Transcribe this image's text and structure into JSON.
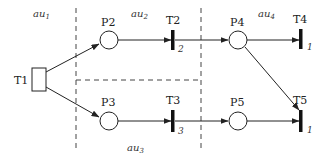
{
  "diagram": {
    "type": "petri-net",
    "zones": [
      {
        "id": "au1",
        "base": "au",
        "sub": "1"
      },
      {
        "id": "au2",
        "base": "au",
        "sub": "2"
      },
      {
        "id": "au3",
        "base": "au",
        "sub": "3"
      },
      {
        "id": "au4",
        "base": "au",
        "sub": "4"
      }
    ],
    "places": [
      {
        "id": "P2",
        "label": "P2"
      },
      {
        "id": "P3",
        "label": "P3"
      },
      {
        "id": "P4",
        "label": "P4"
      },
      {
        "id": "P5",
        "label": "P5"
      }
    ],
    "transitions": [
      {
        "id": "T1",
        "label": "T1",
        "kind": "box",
        "delay": ""
      },
      {
        "id": "T2",
        "label": "T2",
        "kind": "bar",
        "delay": "2"
      },
      {
        "id": "T3",
        "label": "T3",
        "kind": "bar",
        "delay": "3"
      },
      {
        "id": "T4",
        "label": "T4",
        "kind": "bar",
        "delay": "1"
      },
      {
        "id": "T5",
        "label": "T5",
        "kind": "bar",
        "delay": "1"
      }
    ],
    "arcs": [
      {
        "from": "T1",
        "to": "P2"
      },
      {
        "from": "T1",
        "to": "P3"
      },
      {
        "from": "P2",
        "to": "T2"
      },
      {
        "from": "T2",
        "to": "P4"
      },
      {
        "from": "P3",
        "to": "T3"
      },
      {
        "from": "T3",
        "to": "P5"
      },
      {
        "from": "P4",
        "to": "T4"
      },
      {
        "from": "P4",
        "to": "T5"
      },
      {
        "from": "P5",
        "to": "T5"
      }
    ],
    "colors": {
      "stroke": "#222222",
      "dash": "#444444",
      "background": "#ffffff"
    }
  }
}
